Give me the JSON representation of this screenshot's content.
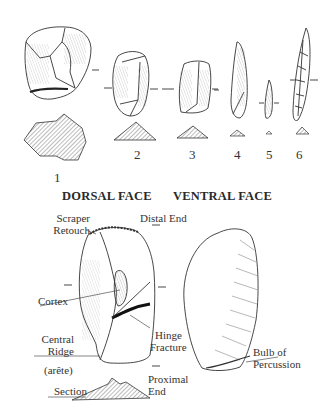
{
  "figure": {
    "artifacts": [
      {
        "id": "1",
        "label": "1"
      },
      {
        "id": "2",
        "label": "2"
      },
      {
        "id": "3",
        "label": "3"
      },
      {
        "id": "4",
        "label": "4"
      },
      {
        "id": "5",
        "label": "5"
      },
      {
        "id": "6",
        "label": "6"
      }
    ],
    "headings": {
      "dorsal": "DORSAL FACE",
      "ventral": "VENTRAL FACE"
    },
    "annotations": {
      "scraper_retouch_1": "Scraper",
      "scraper_retouch_2": "Retouch",
      "distal_end": "Distal End",
      "cortex": "Cortex",
      "central_ridge_1": "Central",
      "central_ridge_2": "Ridge",
      "arete": "(arête)",
      "hinge_fracture_1": "Hinge",
      "hinge_fracture_2": "Fracture",
      "bulb_1": "Bulb of",
      "bulb_2": "Percussion",
      "proximal_1": "Proximal",
      "proximal_2": "End",
      "section": "Section"
    },
    "colors": {
      "ink": "#333333",
      "hatch": "#555555",
      "background": "#ffffff"
    }
  }
}
